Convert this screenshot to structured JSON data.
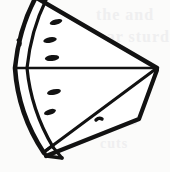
{
  "figure": {
    "style": "black-and-white line drawing",
    "background_color": "#fbfbfa",
    "ink_color": "#121212",
    "canvas": {
      "width": 170,
      "height": 172
    }
  },
  "parts": {
    "flesh_face_label": "Cut flesh face",
    "rind_outer_label": "Outer rind edge",
    "rind_inner_label": "Inner rind line",
    "top_edge_label": "Top cut edge",
    "bottom_edge_label": "Bottom cut edge",
    "mid_edge_label": "Middle horizontal edge",
    "side_face_label": "Side depth face",
    "apex_label": "Wedge apex point",
    "corner_label": "Bottom rind corner"
  },
  "seeds": {
    "label": "Watermelon seeds",
    "count": 5,
    "items": [
      {
        "name": "seed-1",
        "cx": 56,
        "cy": 22,
        "rx": 6.5,
        "ry": 2.6,
        "rot": -16
      },
      {
        "name": "seed-2",
        "cx": 50,
        "cy": 40,
        "rx": 6.8,
        "ry": 2.8,
        "rot": -10
      },
      {
        "name": "seed-3",
        "cx": 52,
        "cy": 58,
        "rx": 7.2,
        "ry": 3.0,
        "rot": -6
      },
      {
        "name": "seed-4",
        "cx": 54,
        "cy": 92,
        "rx": 7.0,
        "ry": 2.8,
        "rot": -12
      },
      {
        "name": "seed-5",
        "cx": 50,
        "cy": 112,
        "rx": 6.2,
        "ry": 2.6,
        "rot": -18
      }
    ]
  },
  "geometry": {
    "apex": {
      "x": 157,
      "y": 68
    },
    "mid_line": {
      "x1": 16,
      "y1": 68,
      "x2": 157,
      "y2": 68
    },
    "top_edge": {
      "x1": 36,
      "y1": -2,
      "x2": 157,
      "y2": 68
    },
    "bottom_edge": {
      "x1": 44,
      "y1": 152,
      "x2": 157,
      "y2": 68
    }
  },
  "ghost_text": {
    "note": "faint show-through text from reverse of page, illegible",
    "line_1": "the  and",
    "line_2": "wear  sturdy",
    "line_3": "and  to",
    "line_4": "cuts"
  }
}
